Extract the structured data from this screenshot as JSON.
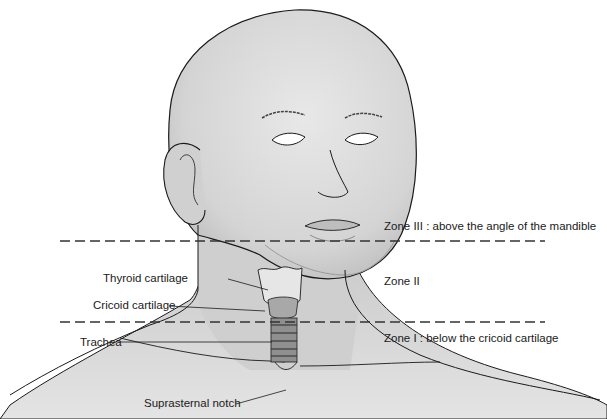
{
  "figure": {
    "zone_labels": [
      {
        "id": "zone3",
        "text": "Zone III :  above the angle of the mandible"
      },
      {
        "id": "zone2",
        "text": "Zone II"
      },
      {
        "id": "zone1",
        "text": "Zone I :  below the cricoid cartilage"
      }
    ],
    "anatomy_labels": [
      {
        "id": "thyroid",
        "text": "Thyroid cartilage"
      },
      {
        "id": "cricoid",
        "text": "Cricoid cartilage"
      },
      {
        "id": "trachea",
        "text": "Trachea"
      },
      {
        "id": "suprasternal",
        "text": "Suprasternal notch"
      }
    ],
    "colors": {
      "skin_fill": "#d9d9d9",
      "skin_shade": "#bdbdbd",
      "outline": "#1a1a1a",
      "dash_line": "#333333",
      "background": "#ffffff"
    }
  }
}
